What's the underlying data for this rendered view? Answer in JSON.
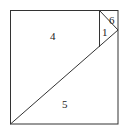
{
  "diagram": {
    "type": "square dissection",
    "outer_square": {
      "x1": 10,
      "y1": 10,
      "x2": 118,
      "y2": 124
    },
    "lines": [
      {
        "name": "main-diagonal",
        "x1": 10,
        "y1": 124,
        "x2": 118,
        "y2": 30
      },
      {
        "name": "vertical-segment",
        "x1": 99,
        "y1": 10,
        "x2": 99,
        "y2": 47
      },
      {
        "name": "small-diagonal",
        "x1": 99,
        "y1": 10,
        "x2": 118,
        "y2": 30
      }
    ],
    "regions": [
      {
        "label": "4",
        "x": 50,
        "y": 40
      },
      {
        "label": "1",
        "x": 102,
        "y": 35
      },
      {
        "label": "6",
        "x": 109,
        "y": 24
      },
      {
        "label": "5",
        "x": 63,
        "y": 108
      }
    ],
    "colors": {
      "line": "#333333",
      "text": "#222222",
      "background": "#ffffff"
    }
  }
}
